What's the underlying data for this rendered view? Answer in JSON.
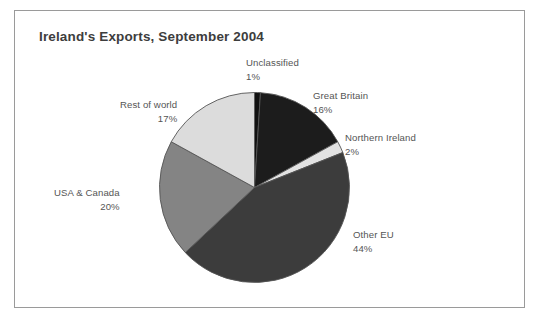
{
  "chart_card": {
    "title": "Ireland's Exports, September 2004",
    "border_color": "#9a9a9a",
    "background": "#ffffff"
  },
  "chart_data": {
    "type": "pie",
    "title": "Ireland's Exports, September 2004",
    "xlabel": "",
    "ylabel": "",
    "legend_position": "none",
    "labels_outside": true,
    "start_angle_deg": 0,
    "direction": "clockwise",
    "categories": [
      "Unclassified",
      "Great Britain",
      "Northern Ireland",
      "Other EU",
      "USA & Canada",
      "Rest of world"
    ],
    "values": [
      1,
      16,
      2,
      44,
      20,
      17
    ],
    "value_labels": [
      "1%",
      "16%",
      "2%",
      "44%",
      "20%",
      "17%"
    ],
    "colors": [
      "#111111",
      "#1c1c1c",
      "#e2e2e2",
      "#3c3c3c",
      "#848484",
      "#dcdcdc"
    ],
    "slice_edge_color": "#555555",
    "slices": [
      {
        "name": "Unclassified",
        "pct_label": "1%",
        "value": 1,
        "color": "#111111"
      },
      {
        "name": "Great Britain",
        "pct_label": "16%",
        "value": 16,
        "color": "#1c1c1c"
      },
      {
        "name": "Northern Ireland",
        "pct_label": "2%",
        "value": 2,
        "color": "#e2e2e2"
      },
      {
        "name": "Other EU",
        "pct_label": "44%",
        "value": 44,
        "color": "#3c3c3c"
      },
      {
        "name": "USA & Canada",
        "pct_label": "20%",
        "value": 20,
        "color": "#848484"
      },
      {
        "name": "Rest of world",
        "pct_label": "17%",
        "value": 17,
        "color": "#dcdcdc"
      }
    ],
    "total": 100,
    "units": "percent"
  }
}
